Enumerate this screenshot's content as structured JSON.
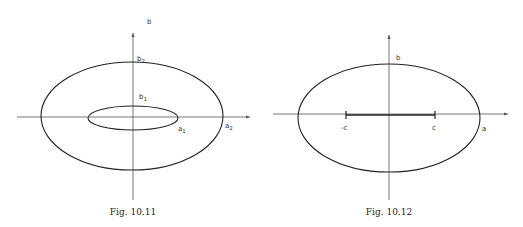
{
  "figures": [
    {
      "caption": "Fig. 10.11",
      "axis_label_vertical": "b",
      "labels": {
        "b2": {
          "base": "b",
          "sub": "2"
        },
        "b1": {
          "base": "b",
          "sub": "1"
        },
        "a1": {
          "base": "a",
          "sub": "1"
        },
        "a2": {
          "base": "a",
          "sub": "2"
        }
      },
      "description": "Two concentric ellipses (outer with semi-axes a2,b2; inner with semi-axes a1,b1) on coordinate axes"
    },
    {
      "caption": "Fig. 10.12",
      "labels": {
        "b": "b",
        "a": "a",
        "c": "c",
        "neg_c": "-c"
      },
      "description": "Ellipse with semi-axes a,b and focal segment from -c to c on horizontal axis"
    }
  ],
  "colors": {
    "line": "#222222",
    "axis": "#555555"
  }
}
